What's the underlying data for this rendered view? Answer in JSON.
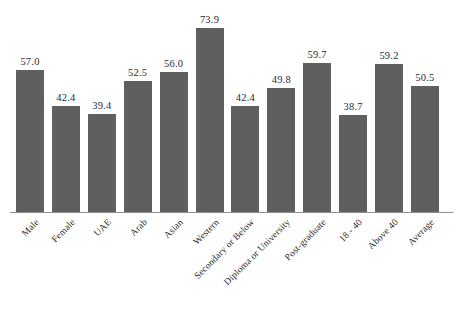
{
  "chart_data": {
    "type": "bar",
    "title": "",
    "subtitle": "",
    "xlabel": "",
    "ylabel": "",
    "ylim": [
      0,
      80
    ],
    "grid": false,
    "legend": "none",
    "bar_color": "#5f5f5f",
    "label_rotation": -45,
    "categories": [
      "Male",
      "Female",
      "UAE",
      "Arab",
      "Asian",
      "Western",
      "Secondary or Below",
      "Diploma or University",
      "Post-graduate",
      "18 - 40",
      "Above 40",
      "Average"
    ],
    "values": [
      57.0,
      42.4,
      39.4,
      52.5,
      56.0,
      73.9,
      42.4,
      49.8,
      59.7,
      38.7,
      59.2,
      50.5
    ],
    "value_labels": [
      "57.0",
      "42.4",
      "39.4",
      "52.5",
      "56.0",
      "73.9",
      "42.4",
      "49.8",
      "59.7",
      "38.7",
      "59.2",
      "50.5"
    ]
  }
}
